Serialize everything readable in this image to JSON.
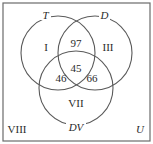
{
  "diagram": {
    "type": "venn",
    "universe_label": "U",
    "sets": [
      {
        "label": "T",
        "cx": 58,
        "cy": 53,
        "r": 37
      },
      {
        "label": "D",
        "cx": 95,
        "cy": 53,
        "r": 37
      },
      {
        "label": "DV",
        "cx": 76,
        "cy": 88,
        "r": 37
      }
    ],
    "regions": {
      "T_only": "I",
      "D_only": "III",
      "DV_only": "VII",
      "outside": "VIII",
      "T_and_D_only": "97",
      "T_and_DV_only": "46",
      "D_and_DV_only": "66",
      "T_and_D_and_DV": "45"
    }
  }
}
